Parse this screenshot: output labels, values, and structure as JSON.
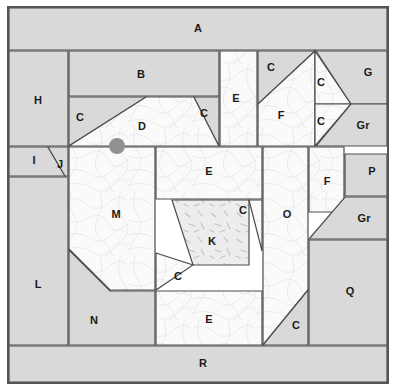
{
  "diagram": {
    "canvas": {
      "width": 397,
      "height": 391
    },
    "colors": {
      "background": "#ffffff",
      "fabric_light": "#fafafa",
      "fabric_gray": "#d9d9d9",
      "fabric_stipple": "#ededed",
      "outline": "#4d4d4d",
      "border": "#555555",
      "marker": "#909090",
      "label_text": "#1a1a1a"
    },
    "frame": {
      "x": 8,
      "y": 7,
      "width": 380,
      "height": 376
    },
    "marker": {
      "name": "pivot-point-marker",
      "cx": 117,
      "cy": 146,
      "r": 8
    },
    "pieces": [
      {
        "id": "A",
        "label": "A",
        "fabric": "gray",
        "lx": 198,
        "ly": 29,
        "points": "9,8 387,8 387,50 9,50"
      },
      {
        "id": "H",
        "label": "H",
        "fabric": "gray",
        "lx": 38,
        "ly": 101,
        "points": "9,51 68,51 68,146 9,146"
      },
      {
        "id": "B",
        "label": "B",
        "fabric": "gray",
        "lx": 141,
        "ly": 75,
        "points": "69,51 219,51 219,96 69,96"
      },
      {
        "id": "C1",
        "label": "C",
        "fabric": "gray",
        "lx": 80,
        "ly": 118,
        "points": "69,97 146,97 69,146"
      },
      {
        "id": "D",
        "label": "D",
        "fabric": "light",
        "lx": 142,
        "ly": 127,
        "points": "146,97 194,97 219,146 69,146"
      },
      {
        "id": "C2",
        "label": "C",
        "fabric": "gray",
        "lx": 204,
        "ly": 114,
        "points": "194,97 219,97 219,146"
      },
      {
        "id": "E1",
        "label": "E",
        "fabric": "light",
        "lx": 236,
        "ly": 99,
        "points": "220,51 257,51 257,146 220,146"
      },
      {
        "id": "C3",
        "label": "C",
        "fabric": "gray",
        "lx": 271,
        "ly": 68,
        "points": "258,51 315,51 258,104"
      },
      {
        "id": "F1",
        "label": "F",
        "fabric": "light",
        "lx": 281,
        "ly": 116,
        "points": "315,51 258,104 258,146 315,146 315,104"
      },
      {
        "id": "C4",
        "label": "C",
        "fabric": "light",
        "lx": 321,
        "ly": 83,
        "points": "315,51 351,104 315,104"
      },
      {
        "id": "C5",
        "label": "C",
        "fabric": "light",
        "lx": 321,
        "ly": 122,
        "points": "315,104 351,104 315,146"
      },
      {
        "id": "G",
        "label": "G",
        "fabric": "gray",
        "lx": 368,
        "ly": 73,
        "points": "316,51 387,51 387,104 351,104"
      },
      {
        "id": "Gr1",
        "label": "Gr",
        "fabric": "gray",
        "lx": 363,
        "ly": 126,
        "points": "351,104 387,104 387,146 316,146"
      },
      {
        "id": "I",
        "label": "I",
        "fabric": "gray",
        "lx": 34,
        "ly": 161,
        "points": "9,147 48,147 65,176 9,176"
      },
      {
        "id": "J",
        "label": "J",
        "fabric": "gray",
        "lx": 60,
        "ly": 165,
        "points": "48,147 68,147 68,176 65,176"
      },
      {
        "id": "M",
        "label": "M",
        "fabric": "light",
        "lx": 116,
        "ly": 215,
        "points": "69,147 155,147 155,290 110,290 69,249"
      },
      {
        "id": "E2",
        "label": "E",
        "fabric": "light",
        "lx": 209,
        "ly": 172,
        "points": "156,147 262,147 262,199 156,199"
      },
      {
        "id": "K",
        "label": "K",
        "fabric": "stipple",
        "lx": 212,
        "ly": 242,
        "points": "172,200 249,200 249,265 193,265"
      },
      {
        "id": "C6",
        "label": "C",
        "fabric": "light",
        "lx": 243,
        "ly": 211,
        "points": "249,200 262,200 262,251"
      },
      {
        "id": "C7",
        "label": "C",
        "fabric": "light",
        "lx": 178,
        "ly": 277,
        "points": "156,253 193,265 156,290"
      },
      {
        "id": "E3",
        "label": "E",
        "fabric": "light",
        "lx": 209,
        "ly": 320,
        "points": "156,291 262,291 262,345 156,345"
      },
      {
        "id": "O",
        "label": "O",
        "fabric": "light",
        "lx": 287,
        "ly": 215,
        "points": "263,147 308,147 308,290 263,345"
      },
      {
        "id": "C8",
        "label": "C",
        "fabric": "gray",
        "lx": 296,
        "ly": 326,
        "points": "308,290 308,345 263,345"
      },
      {
        "id": "F2",
        "label": "F",
        "fabric": "light",
        "lx": 327,
        "ly": 182,
        "points": "309,147 344,147 344,212 309,212"
      },
      {
        "id": "P",
        "label": "P",
        "fabric": "gray",
        "lx": 372,
        "ly": 172,
        "points": "345,154 387,154 387,196 345,196"
      },
      {
        "id": "Gr2",
        "label": "Gr",
        "fabric": "gray",
        "lx": 364,
        "ly": 219,
        "points": "345,197 387,197 387,239 309,239"
      },
      {
        "id": "Q",
        "label": "Q",
        "fabric": "gray",
        "lx": 350,
        "ly": 292,
        "points": "309,240 387,240 387,345 309,345"
      },
      {
        "id": "L",
        "label": "L",
        "fabric": "gray",
        "lx": 38,
        "ly": 285,
        "points": "9,177 68,177 68,345 9,345"
      },
      {
        "id": "N",
        "label": "N",
        "fabric": "gray",
        "lx": 94,
        "ly": 321,
        "points": "69,250 110,291 155,291 155,345 69,345"
      },
      {
        "id": "R",
        "label": "R",
        "fabric": "gray",
        "lx": 203,
        "ly": 364,
        "points": "9,346 387,346 387,382 9,382"
      }
    ]
  }
}
